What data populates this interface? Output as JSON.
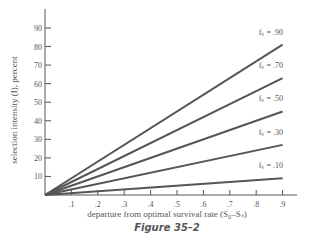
{
  "chart_data": {
    "type": "line",
    "title": "",
    "caption": "Figure 35–2",
    "xlabel": "departure from optimal survival rate (S₀–Sₛ)",
    "ylabel": "selection intensity (I), percent",
    "x_ticks": [
      ".1",
      ".2",
      ".3",
      ".4",
      ".5",
      ".6",
      ".7",
      ".8",
      ".9"
    ],
    "y_ticks": [
      "10",
      "20",
      "30",
      "40",
      "50",
      "60",
      "70",
      "80",
      "90"
    ],
    "xlim": [
      0,
      0.95
    ],
    "ylim": [
      0,
      100
    ],
    "grid": false,
    "legend_position": "inline labels at line ends",
    "series": [
      {
        "name": "fₛ = .90",
        "label": "fₛ = .90",
        "x": [
          0,
          0.9
        ],
        "values": [
          0,
          81
        ]
      },
      {
        "name": "fₛ = .70",
        "label": "fₛ = .70",
        "x": [
          0,
          0.9
        ],
        "values": [
          0,
          63
        ]
      },
      {
        "name": "fₛ = .50",
        "label": "fₛ = .50",
        "x": [
          0,
          0.9
        ],
        "values": [
          0,
          45
        ]
      },
      {
        "name": "fₛ = .30",
        "label": "fₛ = .30",
        "x": [
          0,
          0.9
        ],
        "values": [
          0,
          27
        ]
      },
      {
        "name": "fₛ = .10",
        "label": "fₛ = .10",
        "x": [
          0,
          0.9
        ],
        "values": [
          0,
          9
        ]
      }
    ],
    "line_color": "#555555"
  }
}
